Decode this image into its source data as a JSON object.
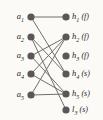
{
  "figure": {
    "type": "bipartite-graph",
    "background_color": "#fbfaf7",
    "node_color": "#585858",
    "edge_color": "#6e6e6e",
    "left_nodes": [
      {
        "id": "a1",
        "base": "a",
        "sub": "1",
        "tag": "",
        "x": 31,
        "y": 17
      },
      {
        "id": "a2",
        "base": "a",
        "sub": "2",
        "tag": "",
        "x": 31,
        "y": 37
      },
      {
        "id": "a3",
        "base": "a",
        "sub": "3",
        "tag": "",
        "x": 31,
        "y": 56
      },
      {
        "id": "a4",
        "base": "a",
        "sub": "4",
        "tag": "",
        "x": 31,
        "y": 74
      },
      {
        "id": "a5",
        "base": "a",
        "sub": "5",
        "tag": "",
        "x": 31,
        "y": 95
      }
    ],
    "right_nodes": [
      {
        "id": "h1",
        "base": "h",
        "sub": "1",
        "tag": "(f)",
        "x": 66,
        "y": 17
      },
      {
        "id": "h2",
        "base": "h",
        "sub": "2",
        "tag": "(f)",
        "x": 66,
        "y": 37
      },
      {
        "id": "h3",
        "base": "h",
        "sub": "3",
        "tag": "(f)",
        "x": 66,
        "y": 56
      },
      {
        "id": "h4",
        "base": "h",
        "sub": "4",
        "tag": "(s)",
        "x": 66,
        "y": 74
      },
      {
        "id": "h5",
        "base": "h",
        "sub": "5",
        "tag": "(s)",
        "x": 66,
        "y": 94
      },
      {
        "id": "l3",
        "base": "l",
        "sub": "3",
        "tag": "(s)",
        "x": 66,
        "y": 110
      }
    ],
    "edges": [
      {
        "from": "a1",
        "to": "h1"
      },
      {
        "from": "a1",
        "to": "h4"
      },
      {
        "from": "a2",
        "to": "h4"
      },
      {
        "from": "a2",
        "to": "l3"
      },
      {
        "from": "a3",
        "to": "h2"
      },
      {
        "from": "a3",
        "to": "h5"
      },
      {
        "from": "a4",
        "to": "h2"
      },
      {
        "from": "a4",
        "to": "h5"
      },
      {
        "from": "a5",
        "to": "h5"
      },
      {
        "from": "a5",
        "to": "h2"
      }
    ]
  }
}
